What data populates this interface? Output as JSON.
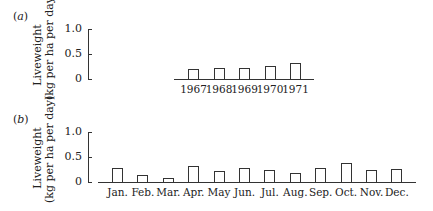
{
  "chart_data": [
    {
      "panel": "(a)",
      "type": "bar",
      "title": "",
      "xlabel": "",
      "ylabel": "Liveweight (kg per ha per day)",
      "yticks": [
        "0",
        "0.5",
        "1.0"
      ],
      "ylim": [
        0,
        1.0
      ],
      "grid": false,
      "categories": [
        "1967",
        "1968",
        "1969",
        "1970",
        "1971"
      ],
      "values": [
        0.2,
        0.22,
        0.23,
        0.26,
        0.32
      ]
    },
    {
      "panel": "(b)",
      "type": "bar",
      "title": "",
      "xlabel": "",
      "ylabel": "Liveweight (kg per ha per day)",
      "yticks": [
        "0",
        "0.5",
        "1.0"
      ],
      "ylim": [
        0,
        1.0
      ],
      "grid": false,
      "categories": [
        "Jan.",
        "Feb.",
        "Mar.",
        "Apr.",
        "May",
        "Jun.",
        "Jul.",
        "Aug.",
        "Sep.",
        "Oct.",
        "Nov.",
        "Dec."
      ],
      "values": [
        0.28,
        0.14,
        0.08,
        0.32,
        0.22,
        0.29,
        0.24,
        0.18,
        0.28,
        0.38,
        0.24,
        0.26
      ]
    }
  ],
  "panels": {
    "a": {
      "label_open": "(",
      "label_letter": "a",
      "label_close": ")",
      "ylabel_line1": "Liveweight",
      "ylabel_line2": "(kg per ha per day)"
    },
    "b": {
      "label_open": "(",
      "label_letter": "b",
      "label_close": ")",
      "ylabel_line1": "Liveweight",
      "ylabel_line2": "(kg per ha per day)"
    }
  }
}
